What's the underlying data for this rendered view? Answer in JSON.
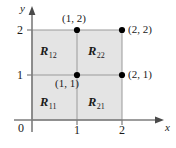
{
  "figure": {
    "type": "coordinate-diagram"
  },
  "axes": {
    "x_label": "x",
    "y_label": "y",
    "origin_label": "0",
    "x_ticks": [
      "1",
      "2"
    ],
    "y_ticks": [
      "1",
      "2"
    ],
    "x_range": [
      0,
      2.6
    ],
    "y_range": [
      0,
      2.45
    ]
  },
  "regions": [
    {
      "name": "R",
      "sub": "12",
      "x": 0.5,
      "y": 1.5
    },
    {
      "name": "R",
      "sub": "22",
      "x": 1.5,
      "y": 1.5
    },
    {
      "name": "R",
      "sub": "11",
      "x": 0.5,
      "y": 0.5
    },
    {
      "name": "R",
      "sub": "21",
      "x": 1.5,
      "y": 0.5
    }
  ],
  "points": [
    {
      "label": "(1, 2)",
      "x": 1,
      "y": 2
    },
    {
      "label": "(2, 2)",
      "x": 2,
      "y": 2
    },
    {
      "label": "(1, 1)",
      "x": 1,
      "y": 1
    },
    {
      "label": "(2, 1)",
      "x": 2,
      "y": 1
    }
  ],
  "colors": {
    "fill": "#e4e4e4",
    "grid": "#9a9a9a",
    "axis": "#7d7d7d",
    "text": "#1a1a1a",
    "dot": "#000000"
  }
}
